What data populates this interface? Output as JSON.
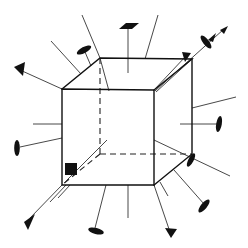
{
  "diagram": {
    "title": "",
    "colors": {
      "background": "#ffffff",
      "ink": "#111111",
      "ray": "#333333"
    },
    "cube": {
      "front_face": [
        [
          62,
          89
        ],
        [
          154,
          90
        ],
        [
          154,
          185
        ],
        [
          62,
          185
        ]
      ],
      "back_face": [
        [
          100,
          58
        ],
        [
          192,
          59
        ],
        [
          192,
          154
        ],
        [
          100,
          154
        ]
      ],
      "hidden_edges": [
        [
          [
            100,
            58
          ],
          [
            100,
            154
          ]
        ],
        [
          [
            100,
            154
          ],
          [
            192,
            154
          ]
        ],
        [
          [
            100,
            154
          ],
          [
            62,
            185
          ]
        ]
      ]
    },
    "rays": [
      {
        "id": "top-left-vertex-arrow",
        "from": [
          62,
          89
        ],
        "to": [
          16,
          68
        ],
        "tip": "arrow"
      },
      {
        "id": "top-left-edge-ray",
        "from": [
          81,
          74
        ],
        "to": [
          51,
          41
        ],
        "tip": "none"
      },
      {
        "id": "top-left-edge-disc",
        "from": [
          91,
          66
        ],
        "to": [
          84,
          50
        ],
        "tip": "disc"
      },
      {
        "id": "back-top-left-ray",
        "from": [
          100,
          58
        ],
        "to": [
          82,
          15
        ],
        "tip": "none"
      },
      {
        "id": "back-top-left-through",
        "from": [
          100,
          58
        ],
        "to": [
          109,
          91
        ],
        "tip": "none"
      },
      {
        "id": "top-face-center-disc",
        "from": [
          128,
          60
        ],
        "to": [
          128,
          26
        ],
        "tip": "parallelogram"
      },
      {
        "id": "top-edge-ray",
        "from": [
          145,
          59
        ],
        "to": [
          158,
          15
        ],
        "tip": "none"
      },
      {
        "id": "top-right-diagonal-arrow",
        "from": [
          154,
          90
        ],
        "to": [
          187,
          54
        ],
        "tip": "arrow"
      },
      {
        "id": "top-right-diagonal-disc",
        "from": [
          154,
          90
        ],
        "to": [
          224,
          29
        ],
        "tip": "disc"
      },
      {
        "id": "right-edge-ray",
        "from": [
          192,
          108
        ],
        "to": [
          236,
          97
        ],
        "tip": "none"
      },
      {
        "id": "right-face-disc",
        "from": [
          180,
          124
        ],
        "to": [
          220,
          124
        ],
        "tip": "vertical-disc"
      },
      {
        "id": "left-face-ray",
        "from": [
          62,
          138
        ],
        "to": [
          33,
          138
        ],
        "tip": "none"
      },
      {
        "id": "left-edge-disc",
        "from": [
          62,
          138
        ],
        "to": [
          17,
          148
        ],
        "tip": "vertical-disc"
      },
      {
        "id": "bottom-left-arrow",
        "from": [
          62,
          185
        ],
        "to": [
          27,
          222
        ],
        "tip": "arrow"
      },
      {
        "id": "bottom-edge-disc",
        "from": [
          105,
          185
        ],
        "to": [
          94,
          230
        ],
        "tip": "disc"
      },
      {
        "id": "bottom-face-ray",
        "from": [
          128,
          185
        ],
        "to": [
          128,
          218
        ],
        "tip": "none"
      },
      {
        "id": "bottom-right-arrow",
        "from": [
          154,
          185
        ],
        "to": [
          170,
          235
        ],
        "tip": "arrow"
      },
      {
        "id": "bottom-right-edge-disc",
        "from": [
          174,
          170
        ],
        "to": [
          205,
          206
        ],
        "tip": "disc"
      },
      {
        "id": "back-bottom-right-ray",
        "from": [
          154,
          140
        ],
        "to": [
          230,
          176
        ],
        "tip": "none"
      },
      {
        "id": "back-bottom-right-disc",
        "from": [
          192,
          154
        ],
        "to": [
          190,
          163
        ],
        "tip": "vertical-disc"
      }
    ],
    "markers": [
      {
        "id": "square-marker",
        "shape": "square",
        "x": 65,
        "y": 163,
        "size": 12
      }
    ]
  }
}
